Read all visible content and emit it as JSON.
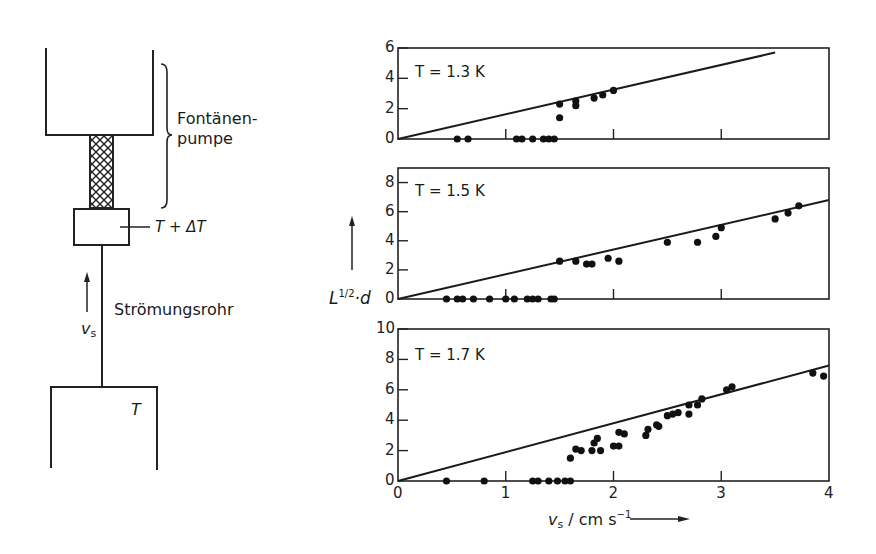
{
  "apparatus": {
    "label_fountain_pump_line1": "Fontänen-",
    "label_fountain_pump_line2": "pumpe",
    "label_heater": "T + ΔT",
    "label_flow_tube": "Strömungsrohr",
    "label_velocity": "v",
    "label_velocity_sub": "s",
    "label_reservoir_temp": "T"
  },
  "axes": {
    "ylabel_main": "L",
    "ylabel_sup": "1/2",
    "ylabel_rest": "·d",
    "xlabel_main": "v",
    "xlabel_sub": "s",
    "xlabel_unit": " / cm s",
    "xlabel_unit_sup": "−1",
    "x_ticks": [
      "0",
      "1",
      "2",
      "3",
      "4"
    ]
  },
  "panels": [
    {
      "title": "T = 1.3 K",
      "y_ticks": [
        "0",
        "2",
        "4",
        "6"
      ]
    },
    {
      "title": "T = 1.5 K",
      "y_ticks": [
        "0",
        "2",
        "4",
        "6",
        "8"
      ]
    },
    {
      "title": "T = 1.7 K",
      "y_ticks": [
        "0",
        "2",
        "4",
        "6",
        "8",
        "10"
      ]
    }
  ],
  "chart_data": [
    {
      "type": "scatter",
      "title": "T = 1.3 K",
      "xlabel": "v_s / cm s^-1",
      "ylabel": "L^1/2 · d",
      "xlim": [
        0,
        4
      ],
      "ylim": [
        0,
        6
      ],
      "y_ticks": [
        0,
        2,
        4,
        6
      ],
      "fit_line": {
        "x": [
          0,
          3.5
        ],
        "y": [
          0,
          5.7
        ]
      },
      "points": [
        [
          0.55,
          0
        ],
        [
          0.65,
          0
        ],
        [
          1.1,
          0
        ],
        [
          1.15,
          0
        ],
        [
          1.25,
          0
        ],
        [
          1.35,
          0
        ],
        [
          1.4,
          0
        ],
        [
          1.45,
          0
        ],
        [
          1.5,
          1.4
        ],
        [
          1.5,
          2.3
        ],
        [
          1.65,
          2.2
        ],
        [
          1.65,
          2.5
        ],
        [
          1.82,
          2.7
        ],
        [
          1.9,
          2.9
        ],
        [
          2.0,
          3.2
        ]
      ]
    },
    {
      "type": "scatter",
      "title": "T = 1.5 K",
      "xlabel": "v_s / cm s^-1",
      "ylabel": "L^1/2 · d",
      "xlim": [
        0,
        4
      ],
      "ylim": [
        0,
        9
      ],
      "y_ticks": [
        0,
        2,
        4,
        6,
        8
      ],
      "fit_line": {
        "x": [
          0,
          4
        ],
        "y": [
          0,
          6.8
        ]
      },
      "points": [
        [
          0.45,
          0
        ],
        [
          0.55,
          0
        ],
        [
          0.6,
          0
        ],
        [
          0.7,
          0
        ],
        [
          0.85,
          0
        ],
        [
          1.0,
          0
        ],
        [
          1.08,
          0
        ],
        [
          1.2,
          0
        ],
        [
          1.25,
          0
        ],
        [
          1.3,
          0
        ],
        [
          1.42,
          0
        ],
        [
          1.45,
          0
        ],
        [
          1.5,
          2.6
        ],
        [
          1.65,
          2.6
        ],
        [
          1.75,
          2.4
        ],
        [
          1.8,
          2.4
        ],
        [
          1.95,
          2.8
        ],
        [
          2.05,
          2.6
        ],
        [
          2.5,
          3.9
        ],
        [
          2.78,
          3.9
        ],
        [
          2.95,
          4.3
        ],
        [
          3.0,
          4.9
        ],
        [
          3.5,
          5.5
        ],
        [
          3.62,
          5.9
        ],
        [
          3.72,
          6.4
        ]
      ]
    },
    {
      "type": "scatter",
      "title": "T = 1.7 K",
      "xlabel": "v_s / cm s^-1",
      "ylabel": "L^1/2 · d",
      "xlim": [
        0,
        4
      ],
      "ylim": [
        0,
        10
      ],
      "y_ticks": [
        0,
        2,
        4,
        6,
        8,
        10
      ],
      "x_ticks": [
        0,
        1,
        2,
        3,
        4
      ],
      "fit_line": {
        "x": [
          0,
          4
        ],
        "y": [
          0,
          7.6
        ]
      },
      "points": [
        [
          0.45,
          0
        ],
        [
          0.8,
          0
        ],
        [
          1.25,
          0
        ],
        [
          1.3,
          0
        ],
        [
          1.4,
          0
        ],
        [
          1.48,
          0
        ],
        [
          1.55,
          0
        ],
        [
          1.6,
          0
        ],
        [
          1.6,
          1.5
        ],
        [
          1.65,
          2.1
        ],
        [
          1.7,
          2.0
        ],
        [
          1.8,
          2.0
        ],
        [
          1.82,
          2.5
        ],
        [
          1.85,
          2.8
        ],
        [
          1.88,
          2.0
        ],
        [
          2.0,
          2.3
        ],
        [
          2.05,
          2.3
        ],
        [
          2.05,
          3.2
        ],
        [
          2.1,
          3.1
        ],
        [
          2.3,
          3.0
        ],
        [
          2.32,
          3.4
        ],
        [
          2.4,
          3.7
        ],
        [
          2.42,
          3.6
        ],
        [
          2.5,
          4.3
        ],
        [
          2.55,
          4.4
        ],
        [
          2.6,
          4.5
        ],
        [
          2.7,
          4.4
        ],
        [
          2.7,
          5.0
        ],
        [
          2.78,
          5.0
        ],
        [
          2.82,
          5.4
        ],
        [
          3.05,
          6.0
        ],
        [
          3.1,
          6.2
        ],
        [
          3.85,
          7.1
        ],
        [
          3.95,
          6.9
        ]
      ]
    }
  ]
}
